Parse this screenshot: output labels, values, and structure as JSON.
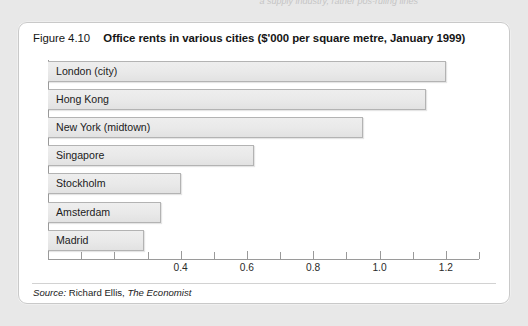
{
  "page": {
    "top_cutoff_text": "a supply industry, rather pos-ruling lines",
    "background_color": "#e8e8e8"
  },
  "figure": {
    "number_label": "Figure 4.10",
    "title": "Office rents in various cities ($'000 per square metre, January 1999)",
    "border_color": "#c9c9c9",
    "background_color": "#ffffff"
  },
  "source": {
    "prefix": "Source:",
    "author": "Richard Ellis,",
    "publication": "The Economist"
  },
  "chart_data": {
    "type": "bar",
    "orientation": "horizontal",
    "title": "Office rents in various cities ($'000 per square metre, January 1999)",
    "xlabel": "",
    "ylabel": "",
    "categories": [
      "London (city)",
      "Hong Kong",
      "New York (midtown)",
      "Singapore",
      "Stockholm",
      "Amsterdam",
      "Madrid"
    ],
    "values": [
      1.2,
      1.14,
      0.95,
      0.62,
      0.4,
      0.34,
      0.29
    ],
    "xlim": [
      0,
      1.3
    ],
    "major_ticks": [
      0.4,
      0.6,
      0.8,
      1.0,
      1.2
    ],
    "major_tick_labels": [
      "0.4",
      "0.6",
      "0.8",
      "1.0",
      "1.2"
    ],
    "minor_ticks": [
      0.1,
      0.2,
      0.3,
      0.5,
      0.7,
      0.9,
      1.1,
      1.3
    ],
    "grid": false,
    "legend": false,
    "bar_fill_color": "#e9e9e9",
    "bar_border_color": "#b3b3b3",
    "axis_color": "#9a9a9a"
  }
}
